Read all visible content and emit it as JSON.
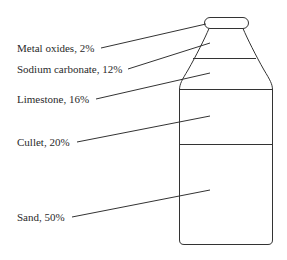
{
  "diagram": {
    "title": "",
    "components": [
      {
        "name": "Metal oxides",
        "percent": 2,
        "label": "Metal oxides, 2%"
      },
      {
        "name": "Sodium carbonate",
        "percent": 12,
        "label": "Sodium carbonate, 12%"
      },
      {
        "name": "Limestone",
        "percent": 16,
        "label": "Limestone, 16%"
      },
      {
        "name": "Cullet",
        "percent": 20,
        "label": "Cullet, 20%"
      },
      {
        "name": "Sand",
        "percent": 50,
        "label": "Sand, 50%"
      }
    ],
    "stroke_color": "#333333",
    "background_color": "#ffffff"
  }
}
